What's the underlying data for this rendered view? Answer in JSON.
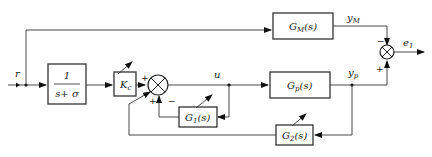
{
  "diagram": {
    "type": "block-diagram",
    "topic": "model reference adaptive control",
    "blocks": {
      "reference_model": {
        "name": "G",
        "sub": "M",
        "arg": "(s)"
      },
      "filter": {
        "numerator": "1",
        "denominator": "s+ σ"
      },
      "gain": {
        "name": "K",
        "sub": "c"
      },
      "plant": {
        "name": "G",
        "sub": "p",
        "arg": "(s)"
      },
      "feedback1": {
        "name": "G",
        "sub": "1",
        "arg": "(s)"
      },
      "feedback2": {
        "name": "G",
        "sub": "2",
        "arg": "(s)"
      }
    },
    "signals": {
      "input": "r",
      "control": "u",
      "model_output": {
        "name": "y",
        "sub": "M"
      },
      "plant_output": {
        "name": "y",
        "sub": "p"
      },
      "error": {
        "name": "e",
        "sub": "1"
      }
    },
    "signs": {
      "sum1_gain": "+",
      "sum1_g1": "−",
      "sum1_g2": "+",
      "sum2_model": "−",
      "sum2_plant": "+"
    }
  }
}
